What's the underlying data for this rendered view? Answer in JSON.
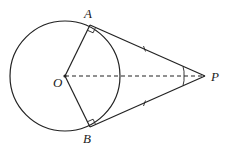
{
  "diagram": {
    "type": "geometry",
    "labels": {
      "A": "A",
      "B": "B",
      "O": "O",
      "P": "P"
    },
    "points": {
      "O": [
        65,
        76
      ],
      "A": [
        90,
        25
      ],
      "B": [
        90,
        127
      ],
      "P": [
        205,
        76
      ]
    },
    "circle": {
      "center": "O",
      "radius": 55
    },
    "segments": [
      "OA",
      "OB",
      "PA",
      "PB"
    ],
    "dashed_segments": [
      "OP"
    ],
    "right_angles": [
      "OAP",
      "OBP"
    ],
    "equal_marks": [
      "PA",
      "PB"
    ],
    "angle_marks": [
      "APO",
      "OPB"
    ],
    "stroke_color": "#222222"
  }
}
